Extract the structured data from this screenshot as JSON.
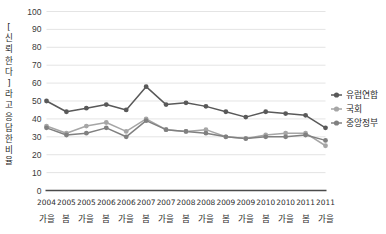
{
  "chart_data": {
    "type": "line",
    "title": "",
    "subtitle": "",
    "xlabel": "",
    "ylabel": "[신뢰한다] 라고 응답한 비율",
    "ylim": [
      0,
      100
    ],
    "ytick_step": 10,
    "yticks": [
      0,
      10,
      20,
      30,
      40,
      50,
      60,
      70,
      80,
      90,
      100
    ],
    "grid": true,
    "legend_position": "right",
    "categories": [
      "2004 가을",
      "2005 봄",
      "2005 가을",
      "2006 봄",
      "2006 가을",
      "2007 봄",
      "2007 가을",
      "2008 봄",
      "2008 가을",
      "2009 봄",
      "2009 가을",
      "2010 봄",
      "2010 가을",
      "2011 봄",
      "2011 가을"
    ],
    "category_years": [
      "2004",
      "2005",
      "2005",
      "2006",
      "2006",
      "2007",
      "2007",
      "2008",
      "2008",
      "2009",
      "2009",
      "2010",
      "2010",
      "2011",
      "2011"
    ],
    "category_seasons": [
      "가을",
      "봄",
      "가을",
      "봄",
      "가을",
      "봄",
      "가을",
      "봄",
      "가을",
      "봄",
      "가을",
      "봄",
      "가을",
      "봄",
      "가을"
    ],
    "series": [
      {
        "name": "유럽연합",
        "color": "#595959",
        "values": [
          50,
          44,
          46,
          48,
          45,
          58,
          48,
          49,
          47,
          44,
          41,
          44,
          43,
          42,
          35
        ]
      },
      {
        "name": "국회",
        "color": "#a6a6a6",
        "values": [
          36,
          32,
          36,
          38,
          33,
          40,
          34,
          33,
          34,
          30,
          29,
          31,
          32,
          32,
          25
        ]
      },
      {
        "name": "중앙정부",
        "color": "#808080",
        "values": [
          35,
          31,
          32,
          35,
          30,
          39,
          34,
          33,
          32,
          30,
          29,
          30,
          30,
          31,
          28
        ]
      }
    ]
  },
  "legend": {
    "items": [
      {
        "label": "유럽연합",
        "color": "#595959"
      },
      {
        "label": "국회",
        "color": "#a6a6a6"
      },
      {
        "label": "중앙정부",
        "color": "#808080"
      }
    ]
  },
  "axis": {
    "y_axis_title": "[신뢰한다] 라고 응답한 비율"
  }
}
